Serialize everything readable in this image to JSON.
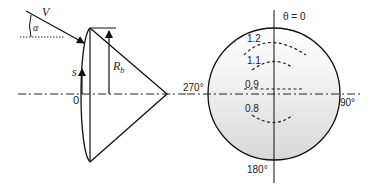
{
  "figure": {
    "left_panel": {
      "labels": {
        "velocity": "V",
        "angle": "α",
        "arc_coord": "s",
        "origin": "0",
        "base_radius": "R",
        "base_radius_sub": "b"
      }
    },
    "right_panel": {
      "labels": {
        "theta_top": "θ = 0",
        "theta_right": "90°",
        "theta_bottom": "180°",
        "theta_left": "270°"
      },
      "contours": [
        {
          "value": "1.2"
        },
        {
          "value": "1.1"
        },
        {
          "value": "0.9"
        },
        {
          "value": "0.8"
        }
      ]
    }
  }
}
